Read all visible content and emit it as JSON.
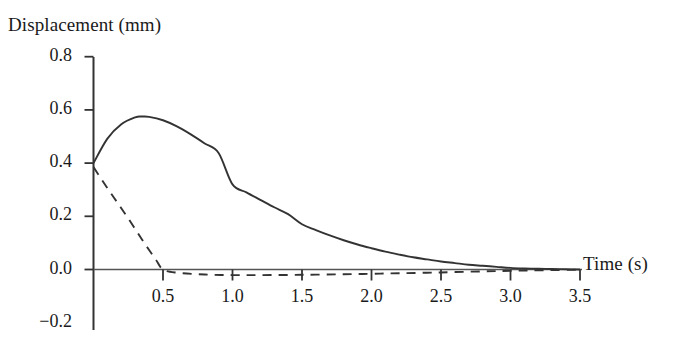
{
  "chart_data": {
    "type": "line",
    "title": "",
    "xlabel": "Time (s)",
    "ylabel": "Displacement (mm)",
    "xlim": [
      0.0,
      3.6
    ],
    "ylim": [
      -0.2,
      0.8
    ],
    "grid": false,
    "legend": "none",
    "x_ticks": [
      "0.5",
      "1.0",
      "1.5",
      "2.0",
      "2.5",
      "3.0",
      "3.5"
    ],
    "x_tick_values": [
      0.5,
      1.0,
      1.5,
      2.0,
      2.5,
      3.0,
      3.5
    ],
    "y_ticks": [
      "0.8",
      "0.6",
      "0.4",
      "0.2",
      "0.0",
      "-0.2"
    ],
    "y_tick_values": [
      0.8,
      0.6,
      0.4,
      0.2,
      0.0,
      -0.2
    ],
    "series": [
      {
        "name": "solid-curve",
        "style": "solid",
        "color": "#333333",
        "x": [
          0.0,
          0.1,
          0.2,
          0.3,
          0.35,
          0.4,
          0.5,
          0.6,
          0.7,
          0.8,
          0.9,
          1.0,
          1.1,
          1.2,
          1.3,
          1.4,
          1.5,
          1.6,
          1.7,
          1.8,
          1.9,
          2.0,
          2.1,
          2.2,
          2.3,
          2.4,
          2.5,
          2.6,
          2.7,
          2.8,
          2.9,
          3.0,
          3.1,
          3.2,
          3.3,
          3.4,
          3.5
        ],
        "y": [
          0.4,
          0.492,
          0.546,
          0.572,
          0.575,
          0.574,
          0.561,
          0.538,
          0.508,
          0.474,
          0.438,
          0.32,
          0.29,
          0.262,
          0.234,
          0.208,
          0.17,
          0.148,
          0.128,
          0.11,
          0.094,
          0.08,
          0.067,
          0.056,
          0.046,
          0.038,
          0.03,
          0.024,
          0.018,
          0.014,
          0.01,
          0.006,
          0.004,
          0.003,
          0.002,
          0.001,
          0.0
        ]
      },
      {
        "name": "dashed-curve",
        "style": "dashed",
        "color": "#333333",
        "x": [
          0.0,
          0.05,
          0.1,
          0.15,
          0.2,
          0.25,
          0.3,
          0.35,
          0.4,
          0.45,
          0.5,
          0.6,
          0.8,
          1.0,
          1.2,
          1.5,
          1.8,
          2.0,
          2.2,
          2.5,
          2.8,
          3.0,
          3.2,
          3.5
        ],
        "y": [
          0.385,
          0.345,
          0.306,
          0.268,
          0.23,
          0.192,
          0.152,
          0.112,
          0.073,
          0.036,
          0.0,
          -0.012,
          -0.019,
          -0.021,
          -0.021,
          -0.02,
          -0.018,
          -0.016,
          -0.014,
          -0.011,
          -0.007,
          -0.005,
          -0.003,
          -0.001
        ]
      }
    ]
  },
  "axes": {
    "x_axis_name": "time-axis",
    "y_axis_name": "displacement-axis"
  }
}
